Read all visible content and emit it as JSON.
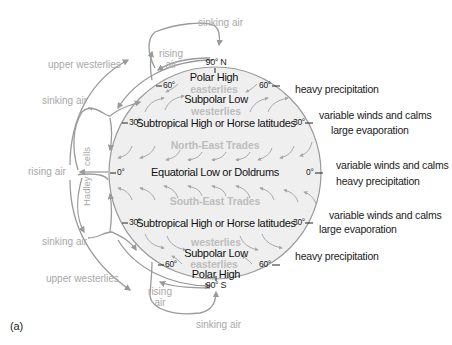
{
  "diagram": {
    "panel_label": "(a)",
    "colors": {
      "globe_fill": "#eeeeee",
      "globe_stroke": "#9a9a9a",
      "circulation_arrows": "#9a9a9a",
      "wind_arrows": "#a8a8a8",
      "zone_text": "#111111",
      "wind_text": "#bdbdbd",
      "atmosphere_text": "#a8a8a8"
    },
    "poles": {
      "north": "90° N",
      "south": "90° S"
    },
    "zones": {
      "north_polar_high": "Polar High",
      "north_easterlies": "easterlies",
      "north_subpolar_low": "Subpolar Low",
      "north_westerlies": "westerlies",
      "north_subtropical_high": "Subtropical High or Horse latitudes",
      "north_east_trades": "North-East Trades",
      "equatorial_low": "Equatorial Low or Doldrums",
      "south_east_trades": "South-East Trades",
      "south_subtropical_high": "Subtropical High or Horse latitudes",
      "south_westerlies": "westerlies",
      "south_subpolar_low": "Subpolar Low",
      "south_easterlies": "easterlies",
      "south_polar_high": "Polar High"
    },
    "latitude_ticks": {
      "left_n60": "60°",
      "left_n30": "30°",
      "left_0": "0°",
      "left_s30": "30°",
      "left_s60": "60°",
      "right_n60": "60°",
      "right_n30": "30°",
      "right_0": "0°",
      "right_s30": "30°",
      "right_s60": "60°"
    },
    "atmosphere_labels": {
      "sinking_air_top": "sinking air",
      "rising_air_top": "rising air",
      "upper_westerlies_top": "upper westerlies",
      "sinking_air_upper_left": "sinking air",
      "hadley_cells": "Hadley",
      "hadley_cells_2": "cells",
      "rising_air_left": "rising air",
      "sinking_air_lower_left": "sinking air",
      "upper_westerlies_bottom": "upper westerlies",
      "rising_air_bottom": "rising air",
      "sinking_air_bottom": "sinking air"
    },
    "climate_notes": {
      "n60": "heavy precipitation",
      "n30_line1": "variable winds and calms",
      "n30_line2": "large evaporation",
      "eq_line1": "variable winds and calms",
      "eq_line2": "heavy precipitation",
      "s30_line1": "variable winds and calms",
      "s30_line2": "large evaporation",
      "s60": "heavy precipitation"
    }
  }
}
